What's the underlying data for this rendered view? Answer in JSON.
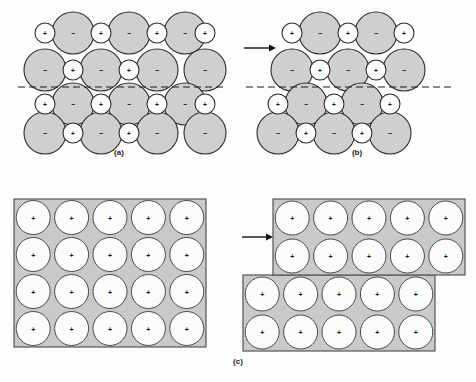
{
  "figure": {
    "panels": [
      {
        "id": "a",
        "label": "(a)"
      },
      {
        "id": "b",
        "label": "(b)"
      },
      {
        "id": "c",
        "label": "(c)"
      }
    ],
    "signs": {
      "positive": "+",
      "negative": "−"
    },
    "colors": {
      "anion_fill": "#cfcfcf",
      "cation_fill": "#fbfbfb",
      "outline": "#2b2b2b",
      "metal_block_fill": "#c9c9c9",
      "metal_block_border": "#555555",
      "metal_atom_fill": "#fbfbfb",
      "slip_line": "#1a1a1a",
      "arrow": "#111111",
      "background": "#fdfdfd"
    },
    "panel_a": {
      "anions": [
        {
          "cx": 73,
          "cy": 33,
          "r": 21,
          "sign": "−"
        },
        {
          "cx": 129,
          "cy": 33,
          "r": 21,
          "sign": "−"
        },
        {
          "cx": 185,
          "cy": 33,
          "r": 21,
          "sign": "−"
        },
        {
          "cx": 45,
          "cy": 70,
          "r": 21,
          "sign": "−"
        },
        {
          "cx": 101,
          "cy": 70,
          "r": 21,
          "sign": "−"
        },
        {
          "cx": 157,
          "cy": 70,
          "r": 21,
          "sign": "−"
        },
        {
          "cx": 205,
          "cy": 70,
          "r": 21,
          "sign": "−"
        },
        {
          "cx": 73,
          "cy": 104,
          "r": 21,
          "sign": "−"
        },
        {
          "cx": 129,
          "cy": 104,
          "r": 21,
          "sign": "−"
        },
        {
          "cx": 185,
          "cy": 104,
          "r": 21,
          "sign": "−"
        },
        {
          "cx": 45,
          "cy": 133,
          "r": 21,
          "sign": "−"
        },
        {
          "cx": 101,
          "cy": 133,
          "r": 21,
          "sign": "−"
        },
        {
          "cx": 157,
          "cy": 133,
          "r": 21,
          "sign": "−"
        },
        {
          "cx": 205,
          "cy": 133,
          "r": 21,
          "sign": "−"
        }
      ],
      "cations": [
        {
          "cx": 45,
          "cy": 33,
          "r": 10,
          "sign": "+"
        },
        {
          "cx": 101,
          "cy": 33,
          "r": 10,
          "sign": "+"
        },
        {
          "cx": 157,
          "cy": 33,
          "r": 10,
          "sign": "+"
        },
        {
          "cx": 205,
          "cy": 33,
          "r": 10,
          "sign": "+"
        },
        {
          "cx": 73,
          "cy": 70,
          "r": 10,
          "sign": "+"
        },
        {
          "cx": 129,
          "cy": 70,
          "r": 10,
          "sign": "+"
        },
        {
          "cx": 45,
          "cy": 104,
          "r": 10,
          "sign": "+"
        },
        {
          "cx": 101,
          "cy": 104,
          "r": 10,
          "sign": "+"
        },
        {
          "cx": 157,
          "cy": 104,
          "r": 10,
          "sign": "+"
        },
        {
          "cx": 205,
          "cy": 104,
          "r": 10,
          "sign": "+"
        },
        {
          "cx": 73,
          "cy": 133,
          "r": 10,
          "sign": "+"
        },
        {
          "cx": 129,
          "cy": 133,
          "r": 10,
          "sign": "+"
        }
      ],
      "slip_line": {
        "x1": 18,
        "x2": 226,
        "y": 87
      }
    },
    "panel_b": {
      "shift": 14,
      "anions_top": [
        {
          "cx": 82,
          "cy": 33,
          "r": 21,
          "sign": "−"
        },
        {
          "cx": 138,
          "cy": 33,
          "r": 21,
          "sign": "−"
        },
        {
          "cx": 54,
          "cy": 70,
          "r": 21,
          "sign": "−"
        },
        {
          "cx": 110,
          "cy": 70,
          "r": 21,
          "sign": "−"
        },
        {
          "cx": 166,
          "cy": 70,
          "r": 21,
          "sign": "−"
        }
      ],
      "cations_top": [
        {
          "cx": 54,
          "cy": 33,
          "r": 10,
          "sign": "+"
        },
        {
          "cx": 110,
          "cy": 33,
          "r": 10,
          "sign": "+"
        },
        {
          "cx": 166,
          "cy": 33,
          "r": 10,
          "sign": "+"
        },
        {
          "cx": 82,
          "cy": 70,
          "r": 10,
          "sign": "+"
        },
        {
          "cx": 138,
          "cy": 70,
          "r": 10,
          "sign": "+"
        }
      ],
      "anions_bottom": [
        {
          "cx": 68,
          "cy": 104,
          "r": 21,
          "sign": "−"
        },
        {
          "cx": 124,
          "cy": 104,
          "r": 21,
          "sign": "−"
        },
        {
          "cx": 40,
          "cy": 133,
          "r": 21,
          "sign": "−"
        },
        {
          "cx": 96,
          "cy": 133,
          "r": 21,
          "sign": "−"
        },
        {
          "cx": 152,
          "cy": 133,
          "r": 21,
          "sign": "−"
        }
      ],
      "cations_bottom": [
        {
          "cx": 40,
          "cy": 104,
          "r": 10,
          "sign": "+"
        },
        {
          "cx": 96,
          "cy": 104,
          "r": 10,
          "sign": "+"
        },
        {
          "cx": 152,
          "cy": 104,
          "r": 10,
          "sign": "+"
        },
        {
          "cx": 68,
          "cy": 133,
          "r": 10,
          "sign": "+"
        },
        {
          "cx": 124,
          "cy": 133,
          "r": 10,
          "sign": "+"
        }
      ],
      "slip_line": {
        "x1": 8,
        "x2": 215,
        "y": 87
      },
      "arrow": {
        "x1": 6,
        "x2": 38,
        "y": 48
      }
    },
    "panel_c": {
      "left_block": {
        "x": 14,
        "y": 199,
        "width": 192,
        "height": 148,
        "cols": 5,
        "rows": 4,
        "atom_radius": 17,
        "sign": "+"
      },
      "right_top_block": {
        "x": 273,
        "y": 199,
        "width": 192,
        "height": 76,
        "cols": 5,
        "rows": 2,
        "atom_radius": 17,
        "sign": "+"
      },
      "right_bottom_block": {
        "x": 243,
        "y": 275,
        "width": 192,
        "height": 76,
        "cols": 5,
        "rows": 2,
        "atom_radius": 17,
        "sign": "+"
      },
      "arrow": {
        "x1": 242,
        "x2": 273,
        "y": 237
      }
    }
  }
}
